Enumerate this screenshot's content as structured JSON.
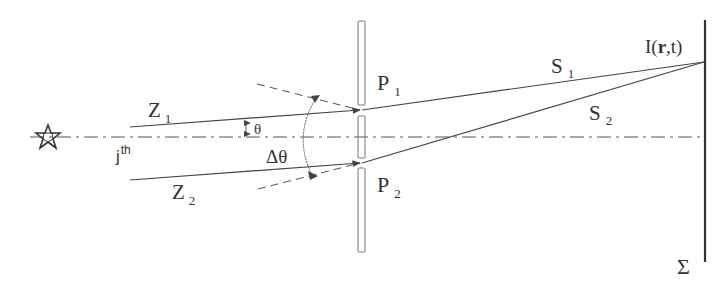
{
  "diagram": {
    "labels": {
      "source": "j",
      "source_sup": "th",
      "ray1": "Z",
      "ray1_sub": "1",
      "ray2": "Z",
      "ray2_sub": "2",
      "angle": "θ",
      "delta_angle": "Δθ",
      "pinhole1": "P",
      "pinhole1_sub": "1",
      "pinhole2": "P",
      "pinhole2_sub": "2",
      "path1": "S",
      "path1_sub": "1",
      "path2": "S",
      "path2_sub": "2",
      "intensity_pre": "I(",
      "intensity_r": "r",
      "intensity_post": ",t)",
      "screen": "Σ"
    },
    "icons": {
      "source": "star-icon"
    },
    "colors": {
      "line": "#444444",
      "background": "#ffffff"
    }
  }
}
